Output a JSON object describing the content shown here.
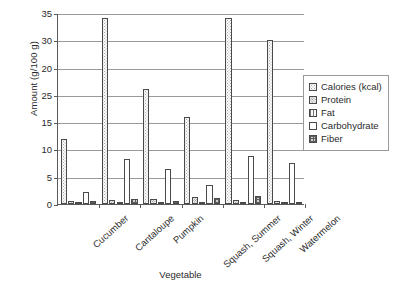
{
  "chart_data": {
    "type": "bar",
    "title": "",
    "xlabel": "Vegetable",
    "ylabel": "Amount (g/100 g)",
    "categories": [
      "Cucumber",
      "Cantaloupe",
      "Pumpkin",
      "Squash, Summer",
      "Squash, Winter",
      "Watermelon"
    ],
    "ylim": [
      0,
      35
    ],
    "ytick_labels": [
      "35",
      "30",
      "20",
      "25",
      "15",
      "10",
      "5",
      "0"
    ],
    "ytick_values": [
      35,
      30,
      25,
      20,
      15,
      10,
      5,
      0
    ],
    "grid": "horizontal",
    "legend_position": "right",
    "series": [
      {
        "name": "Calories (kcal)",
        "pattern": "light-dotted",
        "values": [
          12,
          34,
          21,
          16,
          34,
          30
        ]
      },
      {
        "name": "Protein",
        "pattern": "dense-dotted",
        "values": [
          0.6,
          0.8,
          0.9,
          1.2,
          0.8,
          0.6
        ]
      },
      {
        "name": "Fat",
        "pattern": "vertical-lines",
        "values": [
          0.1,
          0.2,
          0.1,
          0.2,
          0.1,
          0.2
        ]
      },
      {
        "name": "Carbohydrate",
        "pattern": "empty",
        "values": [
          2.2,
          8.2,
          6.5,
          3.4,
          8.8,
          7.5
        ]
      },
      {
        "name": "Fiber",
        "pattern": "dark-checkered",
        "values": [
          0.5,
          0.9,
          0.5,
          1.1,
          1.5,
          0.4
        ]
      }
    ]
  },
  "axis": {
    "y_title": "Amount (g/100 g)",
    "x_title": "Vegetable"
  }
}
